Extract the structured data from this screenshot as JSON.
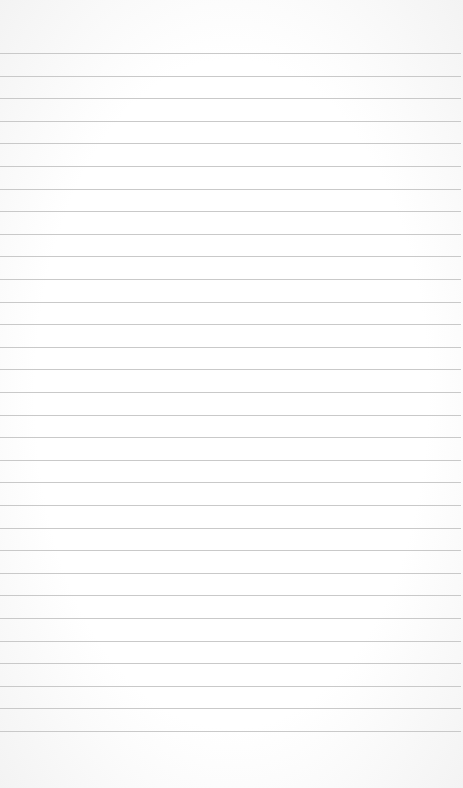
{
  "paper": {
    "type": "lined-notebook-page",
    "background_color": "#ffffff",
    "line_color": "#c9c9c9",
    "line_count": 31,
    "first_line_y": 53,
    "line_spacing": 22.6,
    "content": ""
  }
}
